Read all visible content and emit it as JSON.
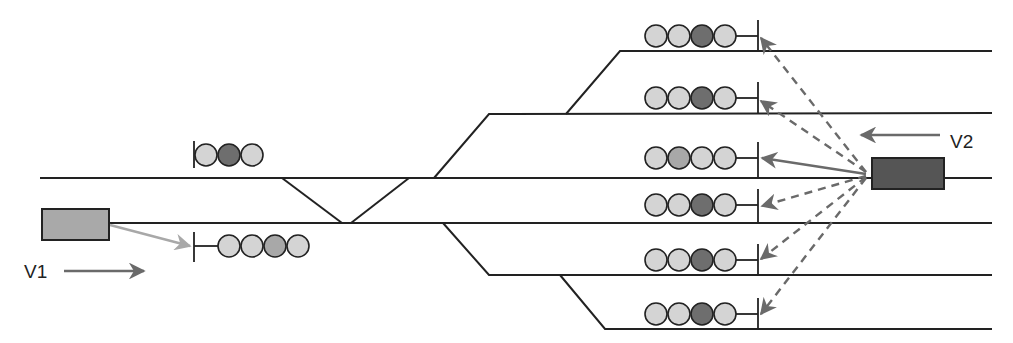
{
  "diagram": {
    "colors": {
      "track": "#222222",
      "lamp_off": "#d4d4d4",
      "lamp_dark": "#6e6e6e",
      "lamp_mid": "#a8a8a8",
      "train_v1": "#a9a9a9",
      "train_v2": "#555555",
      "arrow_v1": "#a8a8a8",
      "arrow_v2": "#6a6a6a"
    },
    "trains": [
      {
        "id": "V1",
        "label": "V1",
        "direction": "right",
        "x": 42,
        "y": 209,
        "w": 67,
        "h": 31
      },
      {
        "id": "V2",
        "label": "V2",
        "direction": "left",
        "x": 872,
        "y": 158,
        "w": 72,
        "h": 31
      }
    ],
    "tracks": [
      {
        "name": "track-main-upper",
        "y": 178,
        "x1": 40,
        "x2": 992
      },
      {
        "name": "track-main-lower",
        "y": 223,
        "x1": 110,
        "x2": 992
      },
      {
        "name": "track-platform-1",
        "y": 51,
        "x1": 620,
        "x2": 992
      },
      {
        "name": "track-platform-2",
        "y": 113,
        "x1": 489,
        "x2": 992
      },
      {
        "name": "track-platform-5",
        "y": 275,
        "x1": 489,
        "x2": 992
      },
      {
        "name": "track-platform-6",
        "y": 329,
        "x1": 605,
        "x2": 992
      }
    ],
    "signals": [
      {
        "name": "signal-left-upper",
        "lamps": [
          "off",
          "dark",
          "off"
        ]
      },
      {
        "name": "signal-left-lower",
        "lamps": [
          "off",
          "off",
          "mid",
          "off"
        ]
      },
      {
        "name": "signal-track-1",
        "lamps": [
          "off",
          "off",
          "dark",
          "off"
        ]
      },
      {
        "name": "signal-track-2",
        "lamps": [
          "off",
          "off",
          "dark",
          "off"
        ]
      },
      {
        "name": "signal-track-3",
        "lamps": [
          "off",
          "mid",
          "off",
          "off"
        ]
      },
      {
        "name": "signal-track-4",
        "lamps": [
          "off",
          "off",
          "dark",
          "off"
        ]
      },
      {
        "name": "signal-track-5",
        "lamps": [
          "off",
          "off",
          "dark",
          "off"
        ]
      },
      {
        "name": "signal-track-6",
        "lamps": [
          "off",
          "off",
          "dark",
          "off"
        ]
      }
    ],
    "routes_from_v2": [
      {
        "target": "signal-track-1",
        "style": "dashed"
      },
      {
        "target": "signal-track-2",
        "style": "dashed"
      },
      {
        "target": "signal-track-3",
        "style": "solid"
      },
      {
        "target": "signal-track-4",
        "style": "dashed"
      },
      {
        "target": "signal-track-5",
        "style": "dashed"
      },
      {
        "target": "signal-track-6",
        "style": "dashed"
      }
    ],
    "routes_from_v1": [
      {
        "target": "signal-left-lower",
        "style": "solid"
      }
    ]
  }
}
